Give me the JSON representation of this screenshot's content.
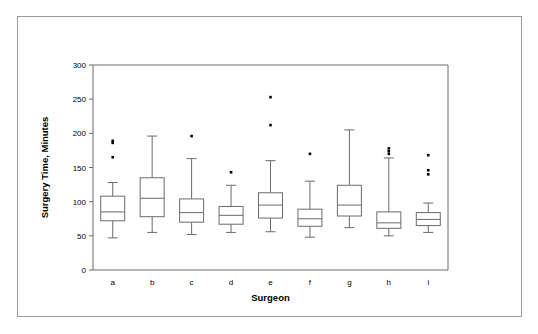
{
  "chart_data": {
    "type": "box",
    "title": "",
    "xlabel": "Surgeon",
    "ylabel": "Surgery Time, Minutes",
    "categories": [
      "a",
      "b",
      "c",
      "d",
      "e",
      "f",
      "g",
      "h",
      "i"
    ],
    "ylim": [
      0,
      300
    ],
    "yticks": [
      0,
      50,
      100,
      150,
      200,
      250,
      300
    ],
    "ytick_labels": [
      "0",
      "50",
      "100",
      "150",
      "200",
      "250",
      "300"
    ],
    "grid": false,
    "legend": "none",
    "box_color": "#ffffff",
    "line_color": "#6b6b6b",
    "outlier_color": "#000000",
    "boxes": [
      {
        "category": "a",
        "whisker_low": 47,
        "q1": 72,
        "median": 85,
        "q3": 108,
        "whisker_high": 128,
        "outliers": [
          189,
          186,
          165
        ]
      },
      {
        "category": "b",
        "whisker_low": 55,
        "q1": 78,
        "median": 105,
        "q3": 135,
        "whisker_high": 196,
        "outliers": []
      },
      {
        "category": "c",
        "whisker_low": 52,
        "q1": 70,
        "median": 84,
        "q3": 104,
        "whisker_high": 163,
        "outliers": [
          196
        ]
      },
      {
        "category": "d",
        "whisker_low": 55,
        "q1": 67,
        "median": 80,
        "q3": 93,
        "whisker_high": 124,
        "outliers": [
          143
        ]
      },
      {
        "category": "e",
        "whisker_low": 56,
        "q1": 76,
        "median": 95,
        "q3": 113,
        "whisker_high": 160,
        "outliers": [
          253,
          212
        ]
      },
      {
        "category": "f",
        "whisker_low": 48,
        "q1": 64,
        "median": 75,
        "q3": 89,
        "whisker_high": 130,
        "outliers": [
          170
        ]
      },
      {
        "category": "g",
        "whisker_low": 62,
        "q1": 79,
        "median": 95,
        "q3": 124,
        "whisker_high": 205,
        "outliers": []
      },
      {
        "category": "h",
        "whisker_low": 50,
        "q1": 61,
        "median": 69,
        "q3": 85,
        "whisker_high": 164,
        "outliers": [
          178,
          174,
          170
        ]
      },
      {
        "category": "i",
        "whisker_low": 55,
        "q1": 65,
        "median": 74,
        "q3": 84,
        "whisker_high": 98,
        "outliers": [
          168,
          146,
          140
        ]
      }
    ]
  }
}
